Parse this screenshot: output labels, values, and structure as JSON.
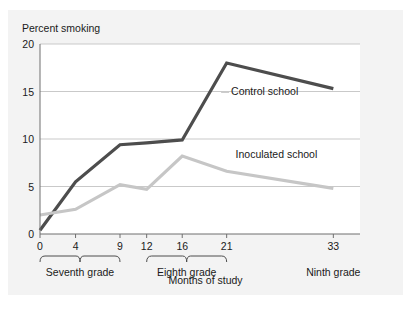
{
  "chart_data": {
    "type": "line",
    "title": "",
    "xlabel": "Months of study",
    "ylabel": "Percent smoking",
    "x": [
      0,
      4,
      9,
      12,
      16,
      21,
      33
    ],
    "xtick_labels": [
      "0",
      "4",
      "9",
      "12",
      "16",
      "21",
      "33"
    ],
    "ytick_labels": [
      "0",
      "5",
      "10",
      "15",
      "20"
    ],
    "ytick_values": [
      0,
      5,
      10,
      15,
      20
    ],
    "ylim": [
      0,
      20
    ],
    "xlim": [
      0,
      36
    ],
    "grid": "horizontal",
    "legend_position": "inline-annotations",
    "series": [
      {
        "name": "Control school",
        "color": "#4d4d4d",
        "values": [
          0.4,
          5.5,
          9.4,
          9.6,
          9.9,
          18.0,
          15.3
        ],
        "label_x": 21.5,
        "label_y": 14.9
      },
      {
        "name": "Inoculated school",
        "color": "#c6c6c6",
        "values": [
          2.0,
          2.6,
          5.2,
          4.7,
          8.2,
          6.6,
          4.8
        ],
        "label_x": 22.0,
        "label_y": 8.3
      }
    ],
    "x_groups": [
      {
        "label": "Seventh grade",
        "start": 0,
        "end": 9
      },
      {
        "label": "Eighth grade",
        "start": 12,
        "end": 21
      },
      {
        "label": "Ninth grade",
        "start": 33,
        "end": 33
      }
    ],
    "colors": {
      "panel_background": "#f3f3f3",
      "plot_background": "#ffffff",
      "gridline": "#c9c9c9",
      "axis_line": "#6f6f6f",
      "text": "#1a1a1a",
      "control_school": "#4d4d4d",
      "inoculated_school": "#c6c6c6"
    }
  }
}
